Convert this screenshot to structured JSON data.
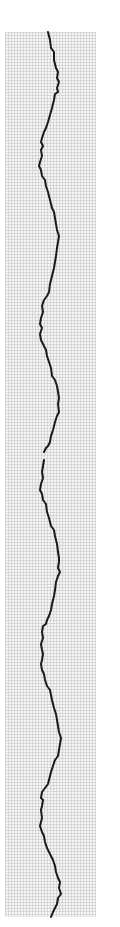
{
  "chart_data": {
    "type": "line",
    "title": "",
    "xlabel": "",
    "ylabel": "",
    "orientation": "vertical-strip",
    "grid": true,
    "legend": null,
    "plot_area": {
      "x": 5,
      "y": 32,
      "width": 91,
      "height": 885
    },
    "grid_spacing_px": 3,
    "colors": {
      "grid": "#bdbdbd",
      "grid_bg": "#f2f2f2",
      "trace": "#1a1a1a"
    },
    "series": [
      {
        "name": "trace-segment-1",
        "points": [
          [
            48,
            32
          ],
          [
            50,
            40
          ],
          [
            51,
            48
          ],
          [
            54,
            52
          ],
          [
            54,
            60
          ],
          [
            56,
            68
          ],
          [
            58,
            72
          ],
          [
            57,
            78
          ],
          [
            59,
            82
          ],
          [
            57,
            88
          ],
          [
            58,
            92
          ],
          [
            55,
            94
          ],
          [
            54,
            100
          ],
          [
            52,
            108
          ],
          [
            50,
            115
          ],
          [
            48,
            122
          ],
          [
            46,
            128
          ],
          [
            44,
            132
          ],
          [
            42,
            138
          ],
          [
            41,
            142
          ],
          [
            43,
            146
          ],
          [
            41,
            150
          ],
          [
            42,
            156
          ],
          [
            40,
            162
          ],
          [
            39,
            166
          ],
          [
            41,
            170
          ],
          [
            42,
            176
          ],
          [
            45,
            180
          ],
          [
            46,
            186
          ],
          [
            48,
            192
          ],
          [
            50,
            200
          ],
          [
            52,
            208
          ],
          [
            54,
            212
          ],
          [
            55,
            218
          ],
          [
            56,
            224
          ],
          [
            57,
            230
          ],
          [
            59,
            236
          ],
          [
            58,
            242
          ],
          [
            57,
            248
          ],
          [
            56,
            256
          ],
          [
            55,
            262
          ],
          [
            54,
            268
          ],
          [
            52,
            276
          ],
          [
            50,
            284
          ],
          [
            49,
            292
          ],
          [
            47,
            296
          ],
          [
            44,
            300
          ],
          [
            42,
            306
          ],
          [
            43,
            312
          ],
          [
            41,
            318
          ],
          [
            40,
            324
          ],
          [
            42,
            328
          ],
          [
            40,
            334
          ],
          [
            41,
            340
          ],
          [
            43,
            344
          ],
          [
            46,
            350
          ],
          [
            47,
            356
          ],
          [
            49,
            362
          ],
          [
            51,
            368
          ],
          [
            52,
            376
          ],
          [
            55,
            380
          ],
          [
            57,
            386
          ],
          [
            58,
            392
          ],
          [
            59,
            398
          ],
          [
            58,
            404
          ],
          [
            59,
            412
          ],
          [
            57,
            416
          ],
          [
            55,
            422
          ],
          [
            53,
            430
          ],
          [
            51,
            436
          ],
          [
            50,
            442
          ],
          [
            48,
            446
          ],
          [
            46,
            448
          ],
          [
            44,
            452
          ]
        ]
      },
      {
        "name": "trace-segment-2",
        "points": [
          [
            44,
            460
          ],
          [
            43,
            466
          ],
          [
            42,
            472
          ],
          [
            43,
            478
          ],
          [
            41,
            484
          ],
          [
            40,
            490
          ],
          [
            42,
            494
          ],
          [
            43,
            500
          ],
          [
            46,
            504
          ],
          [
            47,
            512
          ],
          [
            49,
            518
          ],
          [
            51,
            526
          ],
          [
            54,
            530
          ],
          [
            55,
            536
          ],
          [
            57,
            544
          ],
          [
            58,
            552
          ],
          [
            59,
            558
          ],
          [
            59,
            562
          ],
          [
            58,
            568
          ],
          [
            60,
            572
          ],
          [
            58,
            576
          ],
          [
            56,
            582
          ],
          [
            55,
            590
          ],
          [
            54,
            596
          ],
          [
            52,
            604
          ],
          [
            51,
            610
          ],
          [
            49,
            616
          ],
          [
            47,
            620
          ],
          [
            46,
            624
          ],
          [
            43,
            626
          ],
          [
            42,
            632
          ],
          [
            43,
            638
          ],
          [
            41,
            644
          ],
          [
            42,
            650
          ],
          [
            43,
            654
          ],
          [
            42,
            660
          ],
          [
            41,
            664
          ],
          [
            42,
            670
          ],
          [
            44,
            674
          ],
          [
            45,
            680
          ],
          [
            47,
            686
          ],
          [
            50,
            690
          ],
          [
            52,
            700
          ],
          [
            54,
            708
          ],
          [
            56,
            714
          ],
          [
            57,
            720
          ],
          [
            58,
            726
          ],
          [
            59,
            732
          ],
          [
            61,
            738
          ],
          [
            60,
            744
          ],
          [
            59,
            750
          ],
          [
            58,
            756
          ],
          [
            55,
            760
          ],
          [
            53,
            766
          ],
          [
            51,
            772
          ],
          [
            49,
            780
          ],
          [
            48,
            784
          ],
          [
            45,
            788
          ],
          [
            42,
            792
          ],
          [
            41,
            798
          ],
          [
            43,
            800
          ],
          [
            42,
            806
          ],
          [
            41,
            810
          ],
          [
            42,
            818
          ],
          [
            41,
            822
          ],
          [
            40,
            826
          ],
          [
            42,
            832
          ],
          [
            44,
            836
          ],
          [
            45,
            842
          ],
          [
            47,
            848
          ],
          [
            50,
            854
          ],
          [
            53,
            860
          ],
          [
            55,
            866
          ],
          [
            56,
            872
          ],
          [
            58,
            878
          ],
          [
            60,
            882
          ],
          [
            59,
            888
          ],
          [
            61,
            894
          ],
          [
            58,
            898
          ],
          [
            57,
            904
          ],
          [
            55,
            908
          ],
          [
            53,
            912
          ],
          [
            51,
            917
          ]
        ]
      }
    ]
  }
}
